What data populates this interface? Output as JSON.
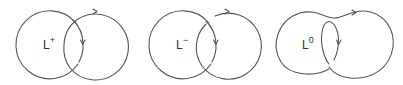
{
  "figure": {
    "stroke_color": "#555555",
    "text_color": "#333333",
    "panels": [
      {
        "id": "L_plus",
        "label_base": "L",
        "label_sup": "+",
        "crossing": "positive"
      },
      {
        "id": "L_minus",
        "label_base": "L",
        "label_sup": "−",
        "crossing": "negative"
      },
      {
        "id": "L_zero",
        "label_base": "L",
        "label_sup": "0",
        "crossing": "smoothed"
      }
    ]
  }
}
